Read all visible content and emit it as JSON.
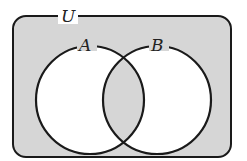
{
  "diagram": {
    "type": "venn",
    "universe_label": "U",
    "sets": [
      {
        "label": "A"
      },
      {
        "label": "B"
      }
    ],
    "shaded_regions": [
      "intersection A∩B",
      "complement of A∪B"
    ],
    "colors": {
      "shade": "#d6d6d6",
      "unshaded": "#ffffff",
      "stroke": "#1a1a1a"
    }
  }
}
